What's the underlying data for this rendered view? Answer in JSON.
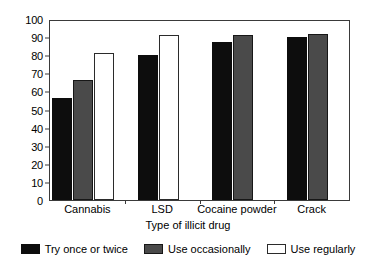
{
  "chart_data": {
    "type": "bar",
    "title": "",
    "subtitle": "",
    "xlabel": "Type of illicit drug",
    "ylabel": "",
    "categories": [
      "Cannabis",
      "LSD",
      "Cocaine powder",
      "Crack"
    ],
    "series": [
      {
        "name": "Try once or twice",
        "color": "#0d0d0d",
        "values": [
          57,
          81,
          88,
          91
        ]
      },
      {
        "name": "Use occasionally",
        "color": "#4a4a4a",
        "values": [
          67,
          null,
          92,
          93
        ]
      },
      {
        "name": "Use regularly",
        "color": "#ffffff",
        "values": [
          82,
          92,
          null,
          null
        ]
      }
    ],
    "ylim": [
      0,
      100
    ],
    "ytick_step": 10,
    "yticks": [
      0,
      10,
      20,
      30,
      40,
      50,
      60,
      70,
      80,
      90,
      100
    ],
    "ytick_labels": [
      "0",
      "10",
      "20",
      "30",
      "40",
      "50",
      "60",
      "70",
      "80",
      "90",
      "100"
    ],
    "grid": false,
    "legend_position": "bottom",
    "frame": true
  },
  "axis": {
    "y_title": "",
    "x_title": "Type of illicit drug"
  },
  "legend": {
    "items": [
      {
        "label": "Try once or twice",
        "swatch": "black-swatch"
      },
      {
        "label": "Use occasionally",
        "swatch": "gray-swatch"
      },
      {
        "label": "Use regularly",
        "swatch": "white-swatch"
      }
    ]
  }
}
